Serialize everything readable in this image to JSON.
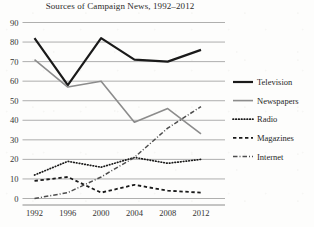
{
  "chart_data": {
    "type": "line",
    "title": "Sources of Campaign News, 1992–2012",
    "xlabel": "",
    "ylabel": "",
    "x": [
      1992,
      1996,
      2000,
      2004,
      2008,
      2012
    ],
    "categories": [
      "1992",
      "1996",
      "2000",
      "2004",
      "2008",
      "2012"
    ],
    "xlim": [
      1992,
      2012
    ],
    "ylim": [
      0,
      90
    ],
    "yticks": [
      0,
      10,
      20,
      30,
      40,
      50,
      60,
      70,
      80,
      90
    ],
    "ytick_labels": [
      "0",
      "10",
      "20",
      "30",
      "40",
      "50",
      "60",
      "70",
      "80",
      "90"
    ],
    "grid": "horizontal",
    "legend_position": "right",
    "series": [
      {
        "name": "Television",
        "values": [
          82,
          58,
          82,
          71,
          70,
          76
        ],
        "color": "#1a1a1a",
        "style": "solid",
        "width": 2.2
      },
      {
        "name": "Newspapers",
        "values": [
          71,
          57,
          60,
          39,
          46,
          33
        ],
        "color": "#8c8c8c",
        "style": "solid",
        "width": 1.6
      },
      {
        "name": "Radio",
        "values": [
          12,
          19,
          16,
          21,
          18,
          20
        ],
        "color": "#1a1a1a",
        "style": "dotted",
        "width": 1.7
      },
      {
        "name": "Magazines",
        "values": [
          9,
          11,
          3,
          7,
          4,
          3
        ],
        "color": "#1a1a1a",
        "style": "dashed",
        "width": 1.8
      },
      {
        "name": "Internet",
        "values": [
          0,
          3,
          11,
          21,
          36,
          47
        ],
        "color": "#4d4d4d",
        "style": "dashdot",
        "width": 1.5
      }
    ]
  },
  "legend": {
    "items": [
      {
        "label": "Television"
      },
      {
        "label": "Newspapers"
      },
      {
        "label": "Radio"
      },
      {
        "label": "Magazines"
      },
      {
        "label": "Internet"
      }
    ]
  }
}
